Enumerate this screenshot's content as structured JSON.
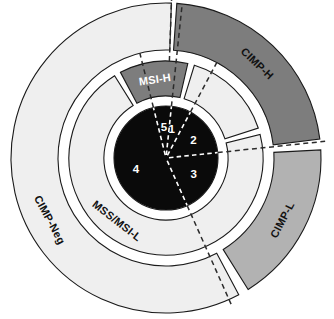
{
  "figure": {
    "type": "sunburst",
    "title": "",
    "center": {
      "x": 166,
      "y": 158
    },
    "background": "#ffffff"
  },
  "colors": {
    "cimp_h": "#7d7d7d",
    "cimp_l": "#b2b2b2",
    "cimp_neg": "#efefef",
    "msi_h": "#7d7d7d",
    "mss_msi_l": "#efefef",
    "mid_light": "#efefef",
    "core": "#0a0a0a",
    "outline": "#1a1a1a",
    "label_dark": "#111111",
    "label_light": "#ffffff"
  },
  "rings": {
    "outer": {
      "name": "CIMP status",
      "r_inner": 108,
      "r_outer": 155,
      "segments": [
        {
          "id": "cimp-h",
          "label": "CIMP-H",
          "color": "#7d7d7d",
          "label_color": "#111111",
          "start_deg": -86,
          "end_deg": -7,
          "label_deg": -46,
          "value_note": "top-right dark grey band"
        },
        {
          "id": "cimp-l",
          "label": "CIMP-L",
          "color": "#b2b2b2",
          "label_color": "#111111",
          "start_deg": -3,
          "end_deg": 58,
          "label_deg": 28,
          "value_note": "right mid-grey band"
        },
        {
          "id": "cimp-neg",
          "label": "CIMP-Neg",
          "color": "#efefef",
          "label_color": "#111111",
          "start_deg": 62,
          "end_deg": 272,
          "label_deg": 152,
          "value_note": "large pale band, bottom-left to top"
        }
      ]
    },
    "middle": {
      "name": "MSI status",
      "r_inner": 62,
      "r_outer": 97,
      "segments": [
        {
          "id": "msi-h",
          "label": "MSI-H",
          "color": "#7d7d7d",
          "label_color": "#ffffff",
          "start_deg": -118,
          "end_deg": -77,
          "label_deg": -98
        },
        {
          "id": "mid-blank",
          "label": "",
          "color": "#efefef",
          "label_color": "#111111",
          "start_deg": -73,
          "end_deg": -18,
          "label_deg": -45
        },
        {
          "id": "mss-msi-l",
          "label": "MSS/MSI-L",
          "color": "#efefef",
          "label_color": "#111111",
          "start_deg": -14,
          "end_deg": 238,
          "label_deg": 128
        }
      ]
    },
    "core": {
      "name": "Molecular subgroups",
      "r_outer": 52,
      "color": "#0a0a0a",
      "sectors": [
        {
          "id": "sector-1",
          "label": "1",
          "start_deg": -96,
          "end_deg": -62,
          "label_deg": -79,
          "label_r": 30
        },
        {
          "id": "sector-2",
          "label": "2",
          "start_deg": -62,
          "end_deg": -6,
          "label_deg": -34,
          "label_r": 33
        },
        {
          "id": "sector-3",
          "label": "3",
          "start_deg": -6,
          "end_deg": 66,
          "label_deg": 30,
          "label_r": 32
        },
        {
          "id": "sector-4",
          "label": "4",
          "start_deg": 66,
          "end_deg": 256,
          "label_deg": 160,
          "label_r": 32
        },
        {
          "id": "sector-5",
          "label": "5",
          "start_deg": 256,
          "end_deg": 276,
          "label_deg": 266,
          "label_r": 31
        }
      ]
    }
  },
  "dashed_radials": [
    {
      "id": "radial-core-1-2",
      "deg": -62,
      "r0": 3,
      "r1": 52,
      "style": "white"
    },
    {
      "id": "radial-core-2-3",
      "deg": -6,
      "r0": 3,
      "r1": 52,
      "style": "white"
    },
    {
      "id": "radial-core-3-4",
      "deg": 66,
      "r0": 3,
      "r1": 52,
      "style": "white"
    },
    {
      "id": "radial-core-4-5",
      "deg": 256,
      "r0": 3,
      "r1": 52,
      "style": "white"
    },
    {
      "id": "radial-core-5-1",
      "deg": 276,
      "r0": 3,
      "r1": 52,
      "style": "white"
    },
    {
      "id": "radial-mid-msih-left",
      "deg": 256,
      "r0": 52,
      "r1": 108,
      "style": "dark"
    },
    {
      "id": "radial-mid-top",
      "deg": 276,
      "r0": 52,
      "r1": 155,
      "style": "dark"
    },
    {
      "id": "radial-mid-msih-right",
      "deg": -62,
      "r0": 52,
      "r1": 108,
      "style": "dark"
    },
    {
      "id": "radial-cimp-h-l",
      "deg": -6,
      "r0": 52,
      "r1": 160,
      "style": "dark"
    },
    {
      "id": "radial-bottom-gap",
      "deg": 66,
      "r0": 52,
      "r1": 160,
      "style": "dark"
    },
    {
      "id": "radial-cimpneg-top",
      "deg": 272,
      "r0": 97,
      "r1": 160,
      "style": "dark"
    }
  ],
  "labels": {
    "outer_ring": [
      "CIMP-H",
      "CIMP-L",
      "CIMP-Neg"
    ],
    "middle_ring": [
      "MSI-H",
      "MSS/MSI-L"
    ],
    "core_numbers": [
      "1",
      "2",
      "3",
      "4",
      "5"
    ]
  },
  "chart_data": {
    "type": "pie",
    "title": "",
    "subtitle": "",
    "xlabel": "",
    "ylabel": "",
    "legend_position": "none",
    "grid": false,
    "series": [
      {
        "name": "CIMP status (outer ring)",
        "categories": [
          "CIMP-H",
          "CIMP-L",
          "CIMP-Neg"
        ],
        "values": [
          79,
          61,
          210
        ],
        "units": "degrees of arc"
      },
      {
        "name": "MSI status (middle ring)",
        "categories": [
          "MSI-H",
          "unlabeled",
          "MSS/MSI-L"
        ],
        "values": [
          41,
          55,
          252
        ],
        "units": "degrees of arc"
      },
      {
        "name": "Molecular subgroups (core)",
        "categories": [
          "1",
          "2",
          "3",
          "4",
          "5"
        ],
        "values": [
          34,
          56,
          72,
          190,
          20
        ],
        "units": "degrees of arc"
      }
    ]
  }
}
